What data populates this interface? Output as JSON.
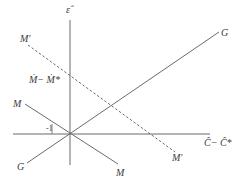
{
  "diagram": {
    "type": "economic-line-diagram",
    "axes": {
      "vertical_label": "ε̂",
      "horizontal_label": "Ĉ− Ĉ*",
      "origin": [
        70,
        134
      ]
    },
    "lines": [
      {
        "name": "G",
        "style": "solid",
        "label_start": "G",
        "label_end": "G"
      },
      {
        "name": "M",
        "style": "solid",
        "label_start": "M",
        "label_end": "M"
      },
      {
        "name": "M'",
        "style": "dashed",
        "label_start": "M′",
        "label_end": "M′"
      }
    ],
    "labels": {
      "epsilon_hat": "ε̂",
      "m_prime_top": "M′",
      "m_diff": "Ṁ− Ṁ*",
      "g_top": "G",
      "m_left": "M",
      "slope_minus_one": "-1",
      "c_diff": "Ĉ− Ĉ*",
      "m_prime_bottom": "M′",
      "g_bottom": "G",
      "m_bottom": "M"
    },
    "colors": {
      "line": "#6b6b6b",
      "text": "#3a3a3a",
      "background": "#ffffff"
    }
  }
}
